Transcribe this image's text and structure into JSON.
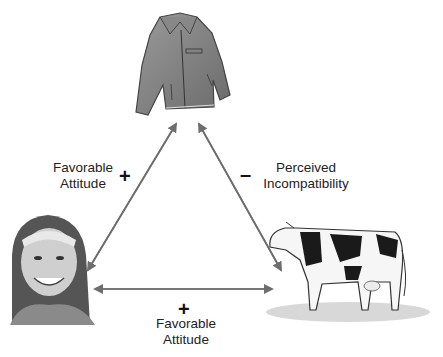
{
  "diagram": {
    "type": "balance-theory-triangle",
    "nodes": {
      "top": {
        "name": "jacket",
        "icon": "jacket-icon"
      },
      "left": {
        "name": "girl",
        "icon": "person-icon"
      },
      "right": {
        "name": "cow",
        "icon": "cow-icon"
      }
    },
    "edges": {
      "left_top": {
        "sign": "+",
        "label_line1": "Favorable",
        "label_line2": "Attitude"
      },
      "right_top": {
        "sign": "–",
        "label_line1": "Perceived",
        "label_line2": "Incompatibility"
      },
      "left_right": {
        "sign": "+",
        "label_line1": "Favorable",
        "label_line2": "Attitude"
      }
    },
    "colors": {
      "arrow": "#6e6e6e",
      "text": "#222222"
    }
  }
}
